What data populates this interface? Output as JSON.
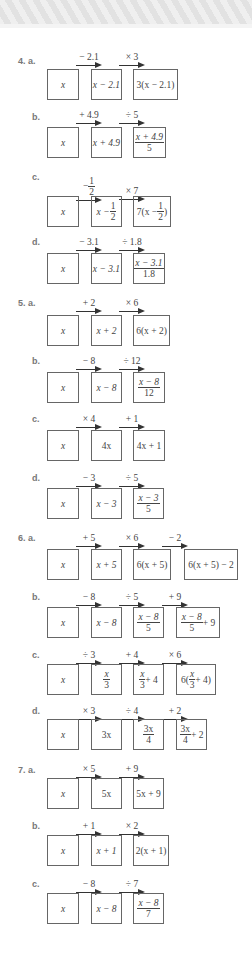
{
  "rows": [
    {
      "id": "4a",
      "label": "4. a.",
      "ops": [
        "− 2.1",
        "× 3"
      ],
      "boxes": [
        "x",
        "x − 2.1",
        "3(x − 2.1)"
      ]
    },
    {
      "id": "4b",
      "label": "b.",
      "ops": [
        "+ 4.9",
        "÷ 5"
      ],
      "boxes": [
        "x",
        "x + 4.9",
        "(x + 4.9)/5"
      ]
    },
    {
      "id": "4c",
      "label": "c.",
      "ops": [
        "− 1/2",
        "× 7"
      ],
      "boxes": [
        "x",
        "x − 1/2",
        "7(x − 1/2)"
      ]
    },
    {
      "id": "4d",
      "label": "d.",
      "ops": [
        "− 3.1",
        "÷ 1.8"
      ],
      "boxes": [
        "x",
        "x − 3.1",
        "(x − 3.1)/1.8"
      ]
    },
    {
      "id": "5a",
      "label": "5. a.",
      "ops": [
        "+ 2",
        "× 6"
      ],
      "boxes": [
        "x",
        "x + 2",
        "6(x + 2)"
      ]
    },
    {
      "id": "5b",
      "label": "b.",
      "ops": [
        "− 8",
        "÷ 12"
      ],
      "boxes": [
        "x",
        "x − 8",
        "(x − 8)/12"
      ]
    },
    {
      "id": "5c",
      "label": "c.",
      "ops": [
        "× 4",
        "+ 1"
      ],
      "boxes": [
        "x",
        "4x",
        "4x + 1"
      ]
    },
    {
      "id": "5d",
      "label": "d.",
      "ops": [
        "− 3",
        "÷ 5"
      ],
      "boxes": [
        "x",
        "x − 3",
        "(x − 3)/5"
      ]
    },
    {
      "id": "6a",
      "label": "6. a.",
      "ops": [
        "+ 5",
        "× 6",
        "− 2"
      ],
      "boxes": [
        "x",
        "x + 5",
        "6(x + 5)",
        "6(x + 5) − 2"
      ]
    },
    {
      "id": "6b",
      "label": "b.",
      "ops": [
        "− 8",
        "÷ 5",
        "+ 9"
      ],
      "boxes": [
        "x",
        "x − 8",
        "(x − 8)/5",
        "(x − 8)/5 + 9"
      ]
    },
    {
      "id": "6c",
      "label": "c.",
      "ops": [
        "÷ 3",
        "+ 4",
        "× 6"
      ],
      "boxes": [
        "x",
        "x/3",
        "x/3 + 4",
        "6(x/3 + 4)"
      ]
    },
    {
      "id": "6d",
      "label": "d.",
      "ops": [
        "× 3",
        "÷ 4",
        "+ 2"
      ],
      "boxes": [
        "x",
        "3x",
        "3x/4",
        "3x/4 + 2"
      ]
    },
    {
      "id": "7a",
      "label": "7. a.",
      "ops": [
        "× 5",
        "+ 9"
      ],
      "boxes": [
        "x",
        "5x",
        "5x + 9"
      ]
    },
    {
      "id": "7b",
      "label": "b.",
      "ops": [
        "+ 1",
        "× 2"
      ],
      "boxes": [
        "x",
        "x + 1",
        "2(x + 1)"
      ]
    },
    {
      "id": "7c",
      "label": "c.",
      "ops": [
        "− 8",
        "÷ 7"
      ],
      "boxes": [
        "x",
        "x − 8",
        "(x − 8)/7"
      ]
    }
  ],
  "frac": {
    "x_m21": "x − 2.1",
    "x_p49": "x + 4.9",
    "five": "5",
    "half_n": "1",
    "half_d": "2",
    "x": "x",
    "x_m": "x −",
    "seven_x": "7(x −",
    "close": ")",
    "x_m31": "x − 3.1",
    "d18": "1.8",
    "x_m8": "x − 8",
    "d12": "12",
    "x_m3": "x − 3",
    "plus9": "+ 9",
    "three": "3",
    "plus4": "+ 4",
    "six_open": "6(",
    "plus4_close": "+ 4)",
    "three_x": "3x",
    "four": "4",
    "plus2": "+ 2",
    "seven": "7",
    "minus": "−"
  }
}
